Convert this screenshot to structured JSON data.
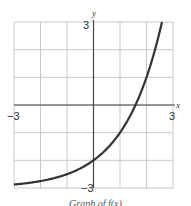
{
  "chart_data": {
    "type": "line",
    "title": "",
    "function": "f(x) = 2^x - 3",
    "xlabel": "x",
    "ylabel": "y",
    "xlim": [
      -3,
      3
    ],
    "ylim": [
      -3,
      3
    ],
    "grid": true,
    "grid_step": 1,
    "tick_labels": {
      "x_min": "−3",
      "x_max": "3",
      "y_max": "3",
      "y_min": "−3"
    },
    "series": [
      {
        "name": "f(x)",
        "x": [
          -3,
          -2,
          -1,
          0,
          1,
          1.585,
          2,
          2.5,
          2.585
        ],
        "y": [
          -2.875,
          -2.75,
          -2.5,
          -2,
          -1,
          0,
          1,
          2.657,
          3
        ]
      }
    ],
    "caption": "Graph of f(x)"
  }
}
